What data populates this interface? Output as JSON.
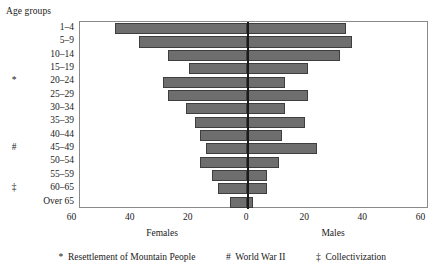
{
  "labels": {
    "age_groups_title": "Age groups",
    "females_caption": "Females",
    "males_caption": "Males"
  },
  "footnotes": [
    {
      "symbol": "*",
      "text": "Resettlement of Mountain People"
    },
    {
      "symbol": "#",
      "text": "World War II"
    },
    {
      "symbol": "‡",
      "text": "Collectivization"
    }
  ],
  "colors": {
    "bar_fill": "#6e6e6e",
    "bar_stroke": "#3e3e3e",
    "axis": "#8a8a8a",
    "zero_line": "#1a1a1a",
    "text": "#1a1a1a"
  },
  "chart_data": {
    "type": "bar",
    "subtype": "population-pyramid",
    "title": "",
    "subtitle": "",
    "xlabel": "",
    "ylabel": "Age groups",
    "orientation": "horizontal",
    "grid": false,
    "legend_position": "none",
    "xlim": [
      -60,
      60
    ],
    "xticks": [
      -60,
      -40,
      -20,
      0,
      20,
      40,
      60
    ],
    "xtick_labels": [
      "60",
      "40",
      "20",
      "0",
      "20",
      "40",
      "60"
    ],
    "left_axis_caption": "Females",
    "right_axis_caption": "Males",
    "categories": [
      "1–4",
      "5–9",
      "10–14",
      "15–19",
      "20–24",
      "25–29",
      "30–34",
      "35–39",
      "40–44",
      "45–49",
      "50–54",
      "55–59",
      "60–65",
      "Over 65"
    ],
    "category_markers": [
      "",
      "",
      "",
      "",
      "*",
      "",
      "",
      "",
      "",
      "#",
      "",
      "",
      "‡",
      ""
    ],
    "series": [
      {
        "name": "Females",
        "side": "left",
        "values": [
          45.5,
          37.0,
          27.0,
          20.0,
          29.0,
          27.0,
          21.0,
          18.0,
          16.0,
          14.0,
          16.0,
          12.0,
          10.0,
          6.0
        ]
      },
      {
        "name": "Males",
        "side": "right",
        "values": [
          34.0,
          36.0,
          32.0,
          21.0,
          13.0,
          21.0,
          13.0,
          20.0,
          12.0,
          24.0,
          11.0,
          7.0,
          7.0,
          2.0
        ]
      }
    ]
  }
}
